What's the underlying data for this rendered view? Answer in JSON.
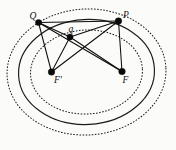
{
  "figure": {
    "background_color": "#fbfbfa",
    "ink_color": "#101010",
    "width": 176,
    "height": 150
  },
  "ellipses": [
    {
      "name": "inner-dashed-ellipse",
      "style": "dashed",
      "cx": 86.5,
      "cy": 72.0,
      "rx": 56.0,
      "ry": 42.0,
      "rotation": -3.0
    },
    {
      "name": "middle-solid-ellipse",
      "style": "solid",
      "cx": 86.5,
      "cy": 72.0,
      "rx": 68.0,
      "ry": 52.5,
      "rotation": -3.0
    },
    {
      "name": "outer-dashed-ellipse",
      "style": "dashed",
      "cx": 86.5,
      "cy": 72.0,
      "rx": 79.5,
      "ry": 63.0,
      "rotation": -3.0
    }
  ],
  "points": [
    {
      "name": "point-Q",
      "label": "Q",
      "x": 38.5,
      "y": 22.5,
      "label_dx": -9.0,
      "label_dy": -4.0,
      "radius": 3.1
    },
    {
      "name": "point-q",
      "label": "q",
      "x": 70.0,
      "y": 37.0,
      "label_dx": -1.5,
      "label_dy": -5.5,
      "radius": 3.1
    },
    {
      "name": "point-P",
      "label": "P",
      "x": 118.5,
      "y": 21.0,
      "label_dx": 4.5,
      "label_dy": -3.5,
      "radius": 3.3
    },
    {
      "name": "focus-F-prime",
      "label": "F'",
      "x": 51.5,
      "y": 72.0,
      "label_dx": 2.5,
      "label_dy": 11.0,
      "radius": 3.3
    },
    {
      "name": "focus-F",
      "label": "F",
      "x": 122.0,
      "y": 71.5,
      "label_dx": 0.5,
      "label_dy": 11.5,
      "radius": 3.3
    }
  ],
  "segments": [
    {
      "name": "segment-Q-to-F-prime",
      "from": "Q",
      "to": "F'",
      "x1": 38.5,
      "y1": 22.5,
      "x2": 51.5,
      "y2": 72.0
    },
    {
      "name": "segment-Q-to-F",
      "from": "Q",
      "to": "F",
      "x1": 38.5,
      "y1": 22.5,
      "x2": 122.0,
      "y2": 71.5
    },
    {
      "name": "segment-Q-to-q",
      "from": "Q",
      "to": "q",
      "x1": 38.5,
      "y1": 22.5,
      "x2": 70.0,
      "y2": 37.0
    },
    {
      "name": "segment-Q-to-P",
      "from": "Q",
      "to": "P",
      "x1": 38.5,
      "y1": 22.5,
      "x2": 118.5,
      "y2": 21.0
    },
    {
      "name": "segment-q-to-F-prime",
      "from": "q",
      "to": "F'",
      "x1": 70.0,
      "y1": 37.0,
      "x2": 51.5,
      "y2": 72.0
    },
    {
      "name": "segment-q-to-F",
      "from": "q",
      "to": "F",
      "x1": 70.0,
      "y1": 37.0,
      "x2": 122.0,
      "y2": 71.5
    },
    {
      "name": "segment-q-to-P",
      "from": "q",
      "to": "P",
      "x1": 70.0,
      "y1": 37.0,
      "x2": 118.5,
      "y2": 21.0
    },
    {
      "name": "segment-P-to-F-prime",
      "from": "P",
      "to": "F'",
      "x1": 118.5,
      "y1": 21.0,
      "x2": 51.5,
      "y2": 72.0
    },
    {
      "name": "segment-P-to-F",
      "from": "P",
      "to": "F",
      "x1": 118.5,
      "y1": 21.0,
      "x2": 122.0,
      "y2": 71.5
    }
  ]
}
